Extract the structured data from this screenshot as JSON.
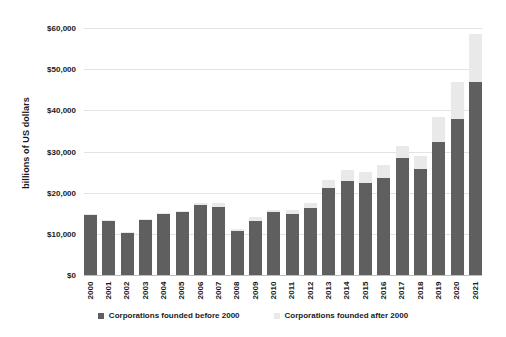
{
  "chart_data": {
    "type": "bar",
    "title": "",
    "xlabel": "",
    "ylabel": "billions of US dollars",
    "ylim": [
      0,
      60000
    ],
    "ytick_step": 10000,
    "grid": true,
    "stacked": true,
    "legend_position": "bottom",
    "categories": [
      "2000",
      "2001",
      "2002",
      "2003",
      "2004",
      "2005",
      "2006",
      "2007",
      "2008",
      "2009",
      "2010",
      "2011",
      "2012",
      "2013",
      "2014",
      "2015",
      "2016",
      "2017",
      "2018",
      "2019",
      "2020",
      "2021"
    ],
    "ytick_labels": [
      "$60,000",
      "$50,000",
      "$40,000",
      "$30,000",
      "$20,000",
      "$10,000",
      "$0"
    ],
    "ytick_values": [
      60000,
      50000,
      40000,
      30000,
      20000,
      10000,
      0
    ],
    "series": [
      {
        "name": "Corporations founded before 2000",
        "color": "#5f5f5f",
        "values": [
          14700,
          13100,
          10200,
          13400,
          14800,
          15200,
          16900,
          16600,
          10800,
          13100,
          15300,
          14900,
          16300,
          21100,
          22900,
          22400,
          23600,
          28500,
          25800,
          32300,
          37900,
          46900
        ]
      },
      {
        "name": "Corporations founded after 2000",
        "color": "#e9e9e9",
        "values": [
          200,
          150,
          150,
          200,
          250,
          400,
          700,
          900,
          400,
          900,
          600,
          800,
          1300,
          2100,
          2700,
          2600,
          3100,
          2900,
          3000,
          6000,
          9000,
          11600
        ]
      }
    ],
    "totals": [
      14900,
      13250,
      10350,
      13600,
      15050,
      15600,
      17600,
      17500,
      11200,
      14000,
      15900,
      15700,
      17600,
      23200,
      25600,
      25000,
      26700,
      31400,
      28800,
      38300,
      46900,
      58500
    ]
  },
  "legend": {
    "items": [
      {
        "label": "Corporations founded before 2000",
        "color": "#5f5f5f"
      },
      {
        "label": "Corporations founded after 2000",
        "color": "#e9e9e9"
      }
    ]
  }
}
